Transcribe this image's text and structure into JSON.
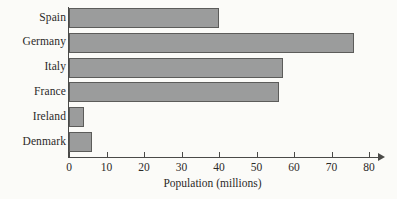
{
  "chart_data": {
    "type": "bar",
    "orientation": "horizontal",
    "title": "",
    "xlabel": "Population (millions)",
    "ylabel": "",
    "categories": [
      "Spain",
      "Germany",
      "Italy",
      "France",
      "Ireland",
      "Denmark"
    ],
    "values": [
      40,
      76,
      57,
      56,
      4,
      6
    ],
    "xlim": [
      0,
      80
    ],
    "xticks": [
      0,
      10,
      20,
      30,
      40,
      50,
      60,
      70,
      80
    ],
    "xtick_labels": [
      "0",
      "10",
      "20",
      "30",
      "40",
      "50",
      "60",
      "70",
      "80"
    ],
    "grid": false,
    "legend": null,
    "bar_fill_color": "#9b9c9c",
    "bar_edge_color": "#5c5c5a",
    "axis_color": "#4a4a48",
    "text_color": "#2b2a28",
    "background_color": "#fbfbf8",
    "axis_arrow": true
  }
}
